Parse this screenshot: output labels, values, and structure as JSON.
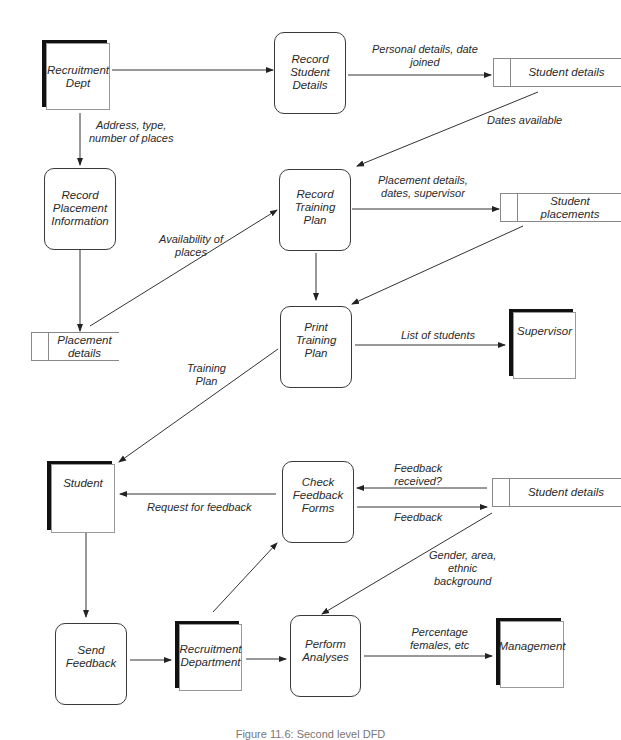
{
  "diagram": {
    "type": "data-flow-diagram",
    "caption": "Figure 11.6: Second level DFD",
    "external_entities": {
      "recruitment_dept": "Recruitment\nDept",
      "supervisor": "Supervisor",
      "student": "Student",
      "recruitment_department": "Recruitment\nDepartment",
      "management": "Management"
    },
    "processes": {
      "record_student_details": "Record\nStudent\nDetails",
      "record_placement_information": "Record\nPlacement\nInformation",
      "record_training_plan": "Record\nTraining\nPlan",
      "print_training_plan": "Print\nTraining\nPlan",
      "check_feedback_forms": "Check\nFeedback\nForms",
      "send_feedback": "Send\nFeedback",
      "perform_analyses": "Perform\nAnalyses"
    },
    "data_stores": {
      "student_details_top": "Student details",
      "student_placements": "Student\nplacements",
      "placement_details": "Placement\ndetails",
      "student_details_bottom": "Student details"
    },
    "flows": {
      "personal_details": "Personal details, date\njoined",
      "address_type": "Address, type,\nnumber of places",
      "dates_available": "Dates available",
      "placement_details_dates": "Placement details,\ndates, supervisor",
      "availability_of_places": "Availability of\nplaces",
      "list_of_students": "List of students",
      "training_plan": "Training\nPlan",
      "feedback_received": "Feedback\nreceived?",
      "request_for_feedback": "Request for feedback",
      "feedback": "Feedback",
      "gender_area": "Gender, area,\nethnic\nbackground",
      "percentage_females": "Percentage\nfemales, etc"
    }
  }
}
